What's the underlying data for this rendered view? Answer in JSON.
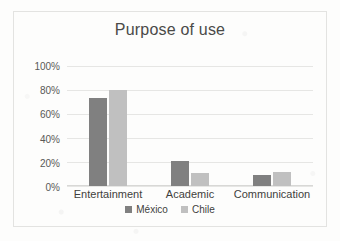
{
  "chart_data": {
    "type": "bar",
    "title": "Purpose of use",
    "xlabel": "",
    "ylabel": "",
    "categories": [
      "Entertainment",
      "Academic",
      "Communication"
    ],
    "series": [
      {
        "name": "México",
        "values": [
          73,
          21,
          9
        ],
        "color": "#808080"
      },
      {
        "name": "Chile",
        "values": [
          80,
          11,
          12
        ],
        "color": "#c0c0c0"
      }
    ],
    "ylim": [
      0,
      100
    ],
    "yticks": [
      0,
      20,
      40,
      60,
      80,
      100
    ],
    "ytick_labels": [
      "0%",
      "20%",
      "40%",
      "60%",
      "80%",
      "100%"
    ],
    "grid": true,
    "legend_position": "bottom",
    "value_suffix": "%"
  },
  "frame": {
    "border_color": "#e3e3e1",
    "background": "#fdfdfc"
  }
}
